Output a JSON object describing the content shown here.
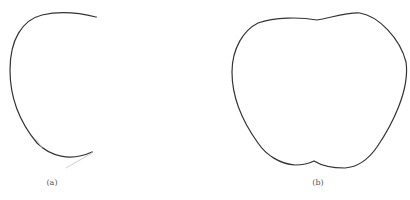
{
  "panels": [
    {
      "id": "a",
      "caption": "(a)",
      "description": "open curve with tangent handles"
    },
    {
      "id": "b",
      "caption": "(b)",
      "description": "closed apple-shaped contour"
    }
  ],
  "colors": {
    "stroke": "#333333",
    "handle": "#c8c8c8",
    "background": "#ffffff"
  }
}
